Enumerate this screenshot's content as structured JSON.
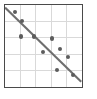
{
  "figure": {
    "kind": "scatter-plot-thumbnail",
    "background_color": "#ffffff",
    "frame_color": "#4a4a4a",
    "grid_color": "#d9d9d9",
    "point_color": "#5c5c5c",
    "trend_line_color": "#6e6e6e"
  },
  "chart_data": {
    "type": "scatter",
    "title": "",
    "subtitle": "",
    "xlabel": "",
    "ylabel": "",
    "xlim": [
      0,
      5
    ],
    "ylim": [
      0,
      5
    ],
    "grid": true,
    "legend": null,
    "xticks": [
      0,
      1,
      2,
      3,
      4,
      5
    ],
    "yticks": [
      0,
      1,
      2,
      3,
      4,
      5
    ],
    "xtick_labels": [
      "",
      "",
      "",
      "",
      "",
      ""
    ],
    "ytick_labels": [
      "",
      "",
      "",
      "",
      "",
      ""
    ],
    "points": [
      {
        "x": 0.66,
        "y": 4.58
      },
      {
        "x": 1.11,
        "y": 4.0
      },
      {
        "x": 1.04,
        "y": 3.06
      },
      {
        "x": 1.92,
        "y": 3.06
      },
      {
        "x": 3.07,
        "y": 2.94
      },
      {
        "x": 2.49,
        "y": 2.1
      },
      {
        "x": 3.62,
        "y": 2.27
      },
      {
        "x": 4.15,
        "y": 1.79
      },
      {
        "x": 3.4,
        "y": 0.99
      },
      {
        "x": 4.48,
        "y": 0.68
      }
    ],
    "trend_line": {
      "type": "line",
      "x": [
        0.0,
        5.0
      ],
      "y": [
        4.85,
        0.28
      ],
      "slope": -0.914,
      "intercept": 4.85,
      "correlation": "negative"
    },
    "annotations": []
  }
}
